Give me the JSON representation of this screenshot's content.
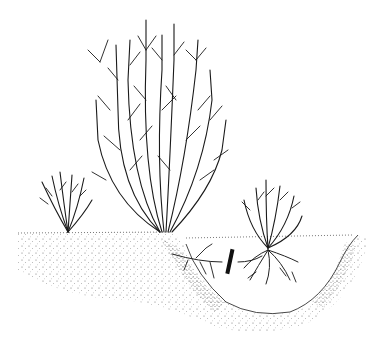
{
  "illustration": {
    "subject": "Shrub propagation by division / layering",
    "elements": [
      {
        "name": "small-shrub-left",
        "description": "Small young shrub on ground at left"
      },
      {
        "name": "large-shrub-center",
        "description": "Tall mature multi-stemmed shrub"
      },
      {
        "name": "rooted-offshoot-right",
        "description": "Young shrub with exposed roots in planting hole"
      },
      {
        "name": "cut-mark",
        "description": "Thick black bar marking where the connecting root is severed"
      },
      {
        "name": "soil",
        "description": "Stippled soil with excavated hollow"
      }
    ],
    "colors": {
      "ink": "#1a1a1a",
      "paper": "#ffffff"
    }
  }
}
